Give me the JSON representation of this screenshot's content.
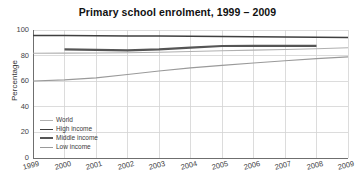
{
  "chart_data": {
    "type": "line",
    "title": "Primary school enrolment, 1999 – 2009",
    "xlabel": "",
    "ylabel": "Percentage",
    "x": [
      1999,
      2000,
      2001,
      2002,
      2003,
      2004,
      2005,
      2006,
      2007,
      2008,
      2009
    ],
    "xticklabels": [
      "1999",
      "2000",
      "2001",
      "2002",
      "2003",
      "2004",
      "2005",
      "2006",
      "2007",
      "2008",
      "2009"
    ],
    "yticklabels": [
      "0",
      "20",
      "40",
      "60",
      "80",
      "100"
    ],
    "yticks": [
      0,
      20,
      40,
      60,
      80,
      100
    ],
    "xlim": [
      1999,
      2009
    ],
    "ylim": [
      0,
      100
    ],
    "grid": true,
    "legend_position": "lower left",
    "series": [
      {
        "name": "World",
        "color": "#b0b0b0",
        "width": 1.1,
        "x": [
          1999,
          2000,
          2001,
          2002,
          2003,
          2004,
          2005,
          2006,
          2007,
          2008,
          2009
        ],
        "values": [
          81.8,
          81.9,
          82.0,
          82.2,
          82.6,
          83.2,
          83.8,
          84.3,
          84.8,
          85.4,
          86.1
        ]
      },
      {
        "name": "High income",
        "color": "#3f3f3f",
        "width": 1.5,
        "x": [
          1999,
          2000,
          2001,
          2002,
          2003,
          2004,
          2005,
          2006,
          2007,
          2008,
          2009
        ],
        "values": [
          95.8,
          95.7,
          95.6,
          95.4,
          95.3,
          95.2,
          95.0,
          94.8,
          94.6,
          94.4,
          94.2
        ]
      },
      {
        "name": "Middle income",
        "color": "#555555",
        "width": 2.2,
        "x": [
          2000,
          2001,
          2002,
          2003,
          2004,
          2005,
          2006,
          2007,
          2008
        ],
        "values": [
          84.8,
          84.4,
          84.1,
          84.8,
          86.3,
          87.5,
          87.6,
          87.6,
          87.6
        ]
      },
      {
        "name": "Low income",
        "color": "#9a9a9a",
        "width": 1.1,
        "x": [
          1999,
          2000,
          2001,
          2002,
          2003,
          2004,
          2005,
          2006,
          2007,
          2008,
          2009
        ],
        "values": [
          60.2,
          61.0,
          62.6,
          65.2,
          68.0,
          70.4,
          72.4,
          74.2,
          76.0,
          77.6,
          79.0
        ]
      }
    ]
  },
  "axes": {
    "y_label": "Percentage"
  }
}
